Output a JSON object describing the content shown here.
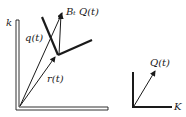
{
  "left_diagram": {
    "axis_label_vertical": "k",
    "vector_q": "q(t)",
    "vector_r": "r(t)",
    "vector_bq": "Bₜ Q(t)",
    "vector_bq_plain": "BtQ(t)"
  },
  "right_diagram": {
    "axis_label_horizontal": "K",
    "vector_Q": "Q(t)"
  },
  "colors": {
    "ink": "#1a1a1a",
    "background": "#ffffff"
  }
}
